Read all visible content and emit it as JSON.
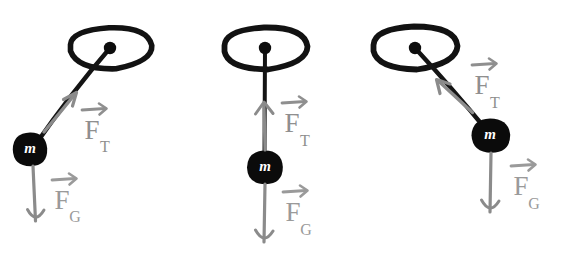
{
  "figure": {
    "background_color": "#ffffff",
    "ink_color_dark": "#111111",
    "ink_color_gray": "#8b8b8b",
    "mass_label": "m",
    "force_symbol": "F",
    "tension_subscript": "T",
    "gravity_subscript": "G",
    "panel_count": 3
  },
  "panels": [
    {
      "id": "panel-left",
      "name": "pendulum-swung-left",
      "description": "Bob displaced to the left of the pivot; string angled down-left",
      "pivot": {
        "x": 110,
        "y": 48
      },
      "bob": {
        "x": 30,
        "y": 149,
        "radius": 17
      },
      "mass_label": "m",
      "support_ellipse": {
        "cx": 110,
        "cy": 48,
        "rx": 42,
        "ry": 21
      },
      "tension": {
        "label_main": "F",
        "label_sub": "T",
        "label_x": 92,
        "label_sub_x": 104,
        "label_y": 133,
        "label_sub_y": 146,
        "arrow_from": {
          "x": 44,
          "y": 132
        },
        "arrow_to": {
          "x": 75,
          "y": 93
        },
        "direction": "up-right along string"
      },
      "gravity": {
        "label_main": "F",
        "label_sub": "G",
        "label_x": 62,
        "label_sub_x": 74,
        "label_y": 203,
        "label_sub_y": 216,
        "arrow_from": {
          "x": 33,
          "y": 166
        },
        "arrow_to": {
          "x": 36,
          "y": 222
        },
        "direction": "down"
      }
    },
    {
      "id": "panel-middle",
      "name": "pendulum-at-rest",
      "description": "Bob hanging straight down below the pivot; string vertical",
      "pivot": {
        "x": 265,
        "y": 48
      },
      "bob": {
        "x": 265,
        "y": 167,
        "radius": 17
      },
      "mass_label": "m",
      "support_ellipse": {
        "cx": 265,
        "cy": 48,
        "rx": 42,
        "ry": 21
      },
      "tension": {
        "label_main": "F",
        "label_sub": "T",
        "label_x": 292,
        "label_sub_x": 304,
        "label_y": 126,
        "label_sub_y": 140,
        "arrow_from": {
          "x": 265,
          "y": 148
        },
        "arrow_to": {
          "x": 264,
          "y": 103
        },
        "direction": "up"
      },
      "gravity": {
        "label_main": "F",
        "label_sub": "G",
        "label_x": 293,
        "label_sub_x": 305,
        "label_y": 215,
        "label_sub_y": 229,
        "arrow_from": {
          "x": 265,
          "y": 186
        },
        "arrow_to": {
          "x": 264,
          "y": 243
        },
        "direction": "down"
      }
    },
    {
      "id": "panel-right",
      "name": "pendulum-swung-right",
      "description": "Bob displaced to the right of the pivot; string angled down-right",
      "pivot": {
        "x": 415,
        "y": 48
      },
      "bob": {
        "x": 490,
        "y": 135,
        "radius": 17
      },
      "mass_label": "m",
      "support_ellipse": {
        "cx": 415,
        "cy": 48,
        "rx": 42,
        "ry": 21
      },
      "tension": {
        "label_main": "F",
        "label_sub": "T",
        "label_x": 482,
        "label_sub_x": 494,
        "label_y": 88,
        "label_sub_y": 102,
        "arrow_from": {
          "x": 472,
          "y": 112
        },
        "arrow_to": {
          "x": 437,
          "y": 80
        },
        "direction": "up-left along string"
      },
      "gravity": {
        "label_main": "F",
        "label_sub": "G",
        "label_x": 521,
        "label_sub_x": 533,
        "label_y": 189,
        "label_sub_y": 203,
        "arrow_from": {
          "x": 491,
          "y": 154
        },
        "arrow_to": {
          "x": 490,
          "y": 213
        },
        "direction": "down"
      }
    }
  ]
}
